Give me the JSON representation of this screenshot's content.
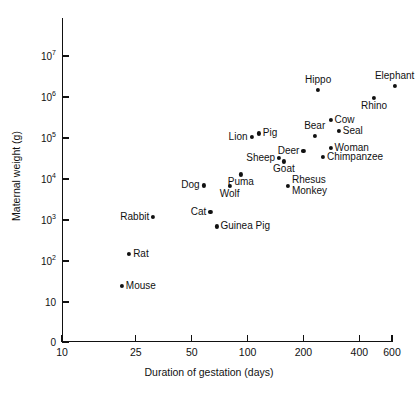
{
  "chart_data": {
    "type": "scatter",
    "title": "",
    "xlabel": "Duration of gestation (days)",
    "ylabel": "Maternal weight (g)",
    "xscale": "log",
    "yscale": "log",
    "xlim": [
      10,
      600
    ],
    "ylim": [
      10,
      10000000
    ],
    "grid": false,
    "legend": "none",
    "xticks": [
      {
        "value": 10,
        "label": "10"
      },
      {
        "value": 25,
        "label": "25"
      },
      {
        "value": 50,
        "label": "50"
      },
      {
        "value": 100,
        "label": "100"
      },
      {
        "value": 200,
        "label": "200"
      },
      {
        "value": 400,
        "label": "400"
      },
      {
        "value": 600,
        "label": "600"
      }
    ],
    "yticks": [
      {
        "value": 10000000,
        "label": "10",
        "exp": "7"
      },
      {
        "value": 1000000,
        "label": "10",
        "exp": "6"
      },
      {
        "value": 100000,
        "label": "10",
        "exp": "5"
      },
      {
        "value": 10000,
        "label": "10",
        "exp": "4"
      },
      {
        "value": 1000,
        "label": "10",
        "exp": "3"
      },
      {
        "value": 100,
        "label": "10",
        "exp": "2"
      },
      {
        "value": 10,
        "label": "10",
        "exp": ""
      },
      {
        "value": 0,
        "label": "0",
        "exp": ""
      }
    ],
    "points": [
      {
        "name": "Mouse",
        "x": 21,
        "y": 25,
        "labelpos": "right"
      },
      {
        "name": "Rat",
        "x": 23,
        "y": 150,
        "labelpos": "right"
      },
      {
        "name": "Rabbit",
        "x": 31,
        "y": 1200,
        "labelpos": "left"
      },
      {
        "name": "Guinea Pig",
        "x": 68,
        "y": 700,
        "labelpos": "right"
      },
      {
        "name": "Cat",
        "x": 63,
        "y": 1600,
        "labelpos": "left"
      },
      {
        "name": "Dog",
        "x": 58,
        "y": 7000,
        "labelpos": "left"
      },
      {
        "name": "Wolf",
        "x": 80,
        "y": 6800,
        "labelpos": "below"
      },
      {
        "name": "Puma",
        "x": 92,
        "y": 13000,
        "labelpos": "below"
      },
      {
        "name": "Rhesus Monkey",
        "x": 165,
        "y": 6800,
        "labelpos": "right"
      },
      {
        "name": "Sheep",
        "x": 148,
        "y": 33000,
        "labelpos": "left"
      },
      {
        "name": "Goat",
        "x": 157,
        "y": 27000,
        "labelpos": "below"
      },
      {
        "name": "Deer",
        "x": 200,
        "y": 48000,
        "labelpos": "left"
      },
      {
        "name": "Lion",
        "x": 105,
        "y": 105000,
        "labelpos": "left"
      },
      {
        "name": "Pig",
        "x": 115,
        "y": 130000,
        "labelpos": "right"
      },
      {
        "name": "Bear",
        "x": 230,
        "y": 110000,
        "labelpos": "above"
      },
      {
        "name": "Cow",
        "x": 280,
        "y": 280000,
        "labelpos": "right"
      },
      {
        "name": "Seal",
        "x": 310,
        "y": 150000,
        "labelpos": "right"
      },
      {
        "name": "Woman",
        "x": 280,
        "y": 57000,
        "labelpos": "right"
      },
      {
        "name": "Chimpanzee",
        "x": 255,
        "y": 34000,
        "labelpos": "right"
      },
      {
        "name": "Hippo",
        "x": 240,
        "y": 1500000,
        "labelpos": "above"
      },
      {
        "name": "Rhino",
        "x": 480,
        "y": 950000,
        "labelpos": "below"
      },
      {
        "name": "Elephant",
        "x": 620,
        "y": 1900000,
        "labelpos": "above"
      }
    ]
  }
}
